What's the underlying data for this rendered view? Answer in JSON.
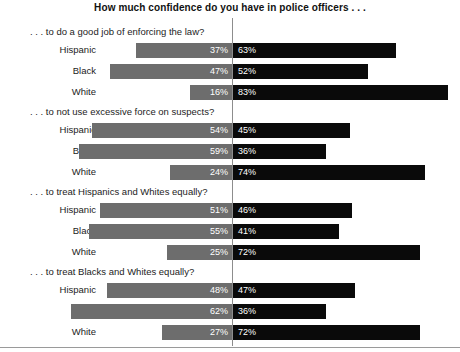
{
  "chart_data": {
    "type": "bar",
    "title": "How much confidence do you have in police officers . . .",
    "xlabel": "",
    "ylabel": "",
    "orientation": "horizontal",
    "layout": "diverging-stacked",
    "grid": false,
    "legend_position": "none",
    "axis_center_percent": 0,
    "categories": [
      "Hispanic",
      "Black",
      "White"
    ],
    "series": [
      {
        "name": "A great deal / quite a lot",
        "color": "#6d6d6d",
        "side": "left"
      },
      {
        "name": "Some / very little",
        "color": "#0a0a0a",
        "side": "right"
      }
    ],
    "sections": [
      {
        "title": ". . . to do a good job of enforcing the law?",
        "rows": [
          {
            "label": "Hispanic",
            "left": 37,
            "right": 63,
            "left_text": "37%",
            "right_text": "63%"
          },
          {
            "label": "Black",
            "left": 47,
            "right": 52,
            "left_text": "47%",
            "right_text": "52%"
          },
          {
            "label": "White",
            "left": 16,
            "right": 83,
            "left_text": "16%",
            "right_text": "83%"
          }
        ]
      },
      {
        "title": ". . . to not use excessive force on suspects?",
        "rows": [
          {
            "label": "Hispanic",
            "left": 54,
            "right": 45,
            "left_text": "54%",
            "right_text": "45%"
          },
          {
            "label": "Black",
            "left": 59,
            "right": 36,
            "left_text": "59%",
            "right_text": "36%"
          },
          {
            "label": "White",
            "left": 24,
            "right": 74,
            "left_text": "24%",
            "right_text": "74%"
          }
        ]
      },
      {
        "title": ". . . to treat Hispanics and Whites equally?",
        "rows": [
          {
            "label": "Hispanic",
            "left": 51,
            "right": 46,
            "left_text": "51%",
            "right_text": "46%"
          },
          {
            "label": "Black",
            "left": 55,
            "right": 41,
            "left_text": "55%",
            "right_text": "41%"
          },
          {
            "label": "White",
            "left": 25,
            "right": 72,
            "left_text": "25%",
            "right_text": "72%"
          }
        ]
      },
      {
        "title": ". . . to treat Blacks and Whites equally?",
        "rows": [
          {
            "label": "Hispanic",
            "left": 48,
            "right": 47,
            "left_text": "48%",
            "right_text": "47%"
          },
          {
            "label": "Black",
            "left": 62,
            "right": 36,
            "left_text": "62%",
            "right_text": "36%"
          },
          {
            "label": "White",
            "left": 27,
            "right": 72,
            "left_text": "27%",
            "right_text": "72%"
          }
        ]
      }
    ]
  }
}
